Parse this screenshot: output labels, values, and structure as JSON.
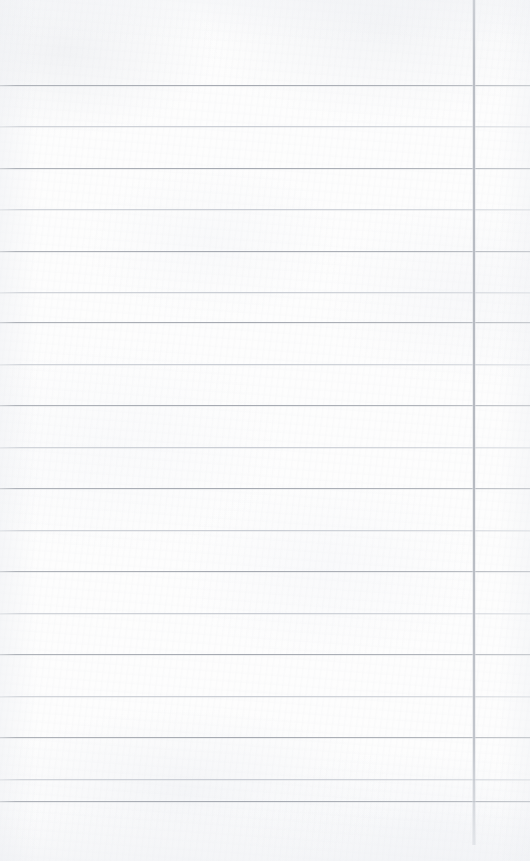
{
  "document": {
    "type": "lined-notepad-page",
    "title": "Blank Ruled Paper",
    "content_text": "",
    "page_width": 530,
    "page_height": 861,
    "paper_color": "#fdfdfd",
    "is_blank": "true"
  },
  "ruling": {
    "horizontal_line_count": 18,
    "first_line_y": 85,
    "line_spacing": 41.5,
    "last_line_y": 801,
    "heavy_line_color": "#a5a9b1",
    "light_line_color": "#c4c8d0",
    "weight_pattern": "alternating heavy/light",
    "lines": [
      {
        "y": 85,
        "weight": "heavy"
      },
      {
        "y": 126,
        "weight": "light"
      },
      {
        "y": 168,
        "weight": "heavy"
      },
      {
        "y": 209,
        "weight": "light"
      },
      {
        "y": 251,
        "weight": "heavy"
      },
      {
        "y": 292,
        "weight": "light"
      },
      {
        "y": 322,
        "weight": "heavy"
      },
      {
        "y": 364,
        "weight": "light"
      },
      {
        "y": 405,
        "weight": "heavy"
      },
      {
        "y": 447,
        "weight": "light"
      },
      {
        "y": 488,
        "weight": "heavy"
      },
      {
        "y": 530,
        "weight": "light"
      },
      {
        "y": 571,
        "weight": "heavy"
      },
      {
        "y": 613,
        "weight": "light"
      },
      {
        "y": 654,
        "weight": "heavy"
      },
      {
        "y": 696,
        "weight": "light"
      },
      {
        "y": 737,
        "weight": "heavy"
      },
      {
        "y": 779,
        "weight": "light"
      },
      {
        "y": 801,
        "weight": "heavy"
      }
    ]
  },
  "margin_rule": {
    "orientation": "vertical",
    "x": 473,
    "width": 2,
    "top": 0,
    "height": 845,
    "color": "#b5b9c0",
    "label": "right margin rule"
  },
  "zones": {
    "header": {
      "top": 0,
      "height": 85,
      "text": ""
    },
    "body": {
      "top": 85,
      "height": 716,
      "text": ""
    },
    "footer": {
      "top": 801,
      "height": 60,
      "text": ""
    },
    "margin_column": {
      "left": 475,
      "width": 55,
      "text": ""
    }
  }
}
